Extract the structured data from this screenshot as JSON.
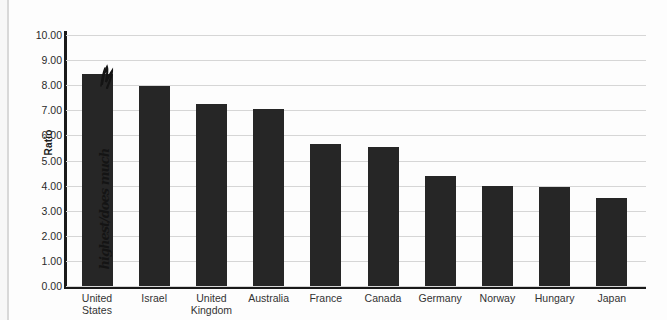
{
  "chart_data": {
    "type": "bar",
    "title": "",
    "xlabel": "",
    "ylabel": "Ratio",
    "ylim": [
      0,
      10
    ],
    "ytick_step": 1,
    "grid": true,
    "legend": "none",
    "categories": [
      "United States",
      "Israel",
      "United Kingdom",
      "Australia",
      "France",
      "Canada",
      "Germany",
      "Norway",
      "Hungary",
      "Japan"
    ],
    "category_lines": [
      [
        "United",
        "States"
      ],
      [
        "Israel",
        ""
      ],
      [
        "United",
        "Kingdom"
      ],
      [
        "Australia",
        ""
      ],
      [
        "France",
        ""
      ],
      [
        "Canada",
        ""
      ],
      [
        "Germany",
        ""
      ],
      [
        "Norway",
        ""
      ],
      [
        "Hungary",
        ""
      ],
      [
        "Japan",
        ""
      ]
    ],
    "values": [
      8.45,
      7.95,
      7.25,
      7.05,
      5.65,
      5.55,
      4.4,
      4.0,
      3.95,
      3.5
    ],
    "ytick_labels": [
      "0.00",
      "1.00",
      "2.00",
      "3.00",
      "4.00",
      "5.00",
      "6.00",
      "7.00",
      "8.00",
      "9.00",
      "10.00"
    ],
    "bar_color": "#262626",
    "grid_color": "#d6d6d6",
    "axis_color": "#1a1a1a"
  },
  "annotation": {
    "handwritten_note": "highest/does much",
    "marker": "arrow-head"
  }
}
